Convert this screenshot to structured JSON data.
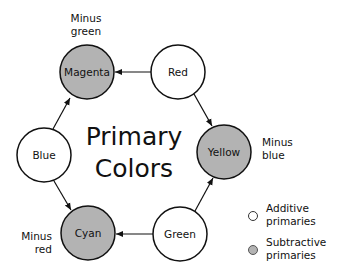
{
  "title": {
    "line1": "Primary",
    "line2": "Colors"
  },
  "colors": {
    "additive_fill": "#ffffff",
    "subtractive_fill": "#b3b3b3",
    "stroke": "#111111"
  },
  "nodes": [
    {
      "id": "magenta",
      "label": "Magenta",
      "type": "subtractive",
      "cx": 87,
      "cy": 72
    },
    {
      "id": "red",
      "label": "Red",
      "type": "additive",
      "cx": 178,
      "cy": 72
    },
    {
      "id": "yellow",
      "label": "Yellow",
      "type": "subtractive",
      "cx": 224,
      "cy": 152
    },
    {
      "id": "green",
      "label": "Green",
      "type": "additive",
      "cx": 180,
      "cy": 234
    },
    {
      "id": "cyan",
      "label": "Cyan",
      "type": "subtractive",
      "cx": 88,
      "cy": 233
    },
    {
      "id": "blue",
      "label": "Blue",
      "type": "additive",
      "cx": 44,
      "cy": 155
    }
  ],
  "notes": {
    "magenta": {
      "line1": "Minus",
      "line2": "green"
    },
    "yellow": {
      "line1": "Minus",
      "line2": "blue"
    },
    "cyan": {
      "line1": "Minus",
      "line2": "red"
    }
  },
  "legend": {
    "additive": {
      "line1": "Additive",
      "line2": "primaries"
    },
    "subtractive": {
      "line1": "Subtractive",
      "line2": "primaries"
    }
  }
}
